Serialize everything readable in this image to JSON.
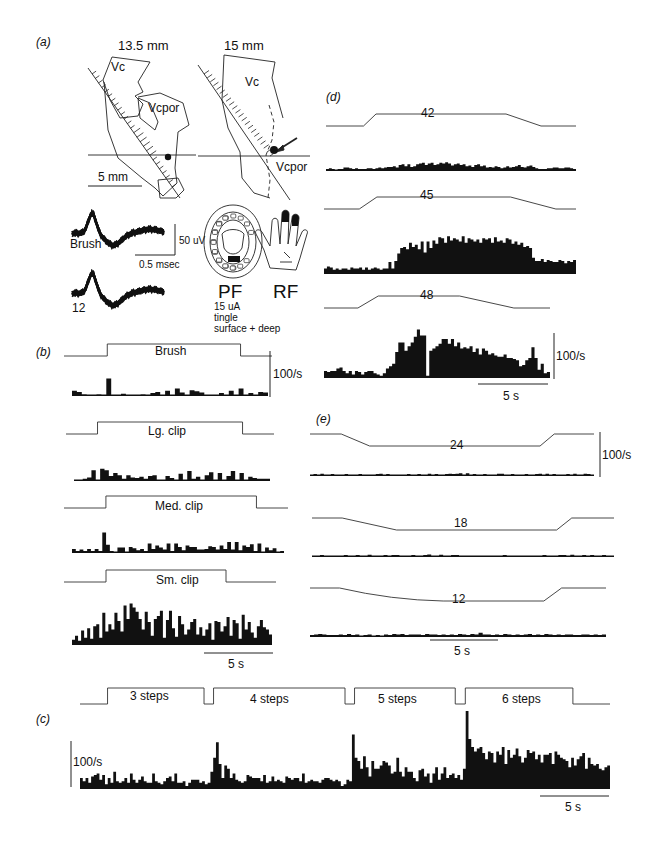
{
  "figure": {
    "panels": {
      "a": {
        "label": "(a)",
        "sections": [
          {
            "title": "13.5 mm",
            "regions": [
              "Vc",
              "Vcpor"
            ],
            "scale_bar": "5 mm"
          },
          {
            "title": "15 mm",
            "regions": [
              "Vc",
              "Vcpor"
            ]
          }
        ],
        "waveforms": [
          {
            "label": "Brush"
          },
          {
            "label": "12"
          }
        ],
        "waveform_scale": {
          "amplitude": "50 uV",
          "time": "0.5 msec"
        },
        "projected_field": {
          "label": "PF",
          "notes": [
            "15 uA",
            "tingle",
            "surface + deep"
          ]
        },
        "receptive_field": {
          "label": "RF"
        }
      },
      "b": {
        "label": "(b)",
        "scale_rate": "100/s",
        "scale_time": "5 s"
      },
      "c": {
        "label": "(c)",
        "scale_rate": "100/s",
        "scale_time": "5 s"
      },
      "d": {
        "label": "(d)",
        "scale_rate": "100/s",
        "scale_time": "5 s"
      },
      "e": {
        "label": "(e)",
        "scale_rate": "100/s",
        "scale_time": "5 s"
      }
    }
  },
  "chart_data": [
    {
      "panel": "b",
      "type": "bar",
      "title": "Brush",
      "ylabel": "100/s",
      "xlabel": "5 s",
      "stimulus": "step",
      "stim_on_frac": [
        0.18,
        0.86
      ],
      "values": [
        18,
        14,
        6,
        4,
        2,
        6,
        2,
        60,
        2,
        2,
        8,
        2,
        4,
        4,
        6,
        4,
        10,
        14,
        2,
        18,
        2,
        26,
        12,
        4,
        20,
        16,
        12,
        4,
        2,
        4,
        10,
        2,
        18,
        2,
        26,
        2,
        10,
        2,
        14,
        12
      ]
    },
    {
      "panel": "b",
      "type": "bar",
      "title": "Lg. clip",
      "ylabel": "100/s",
      "xlabel": "5 s",
      "stimulus": "step",
      "stim_on_frac": [
        0.12,
        0.86
      ],
      "values": [
        4,
        2,
        6,
        10,
        30,
        4,
        34,
        30,
        14,
        22,
        16,
        6,
        16,
        10,
        8,
        12,
        6,
        14,
        16,
        4,
        4,
        14,
        8,
        4,
        20,
        4,
        28,
        6,
        12,
        4,
        16,
        24,
        4,
        22,
        2,
        14,
        28,
        4,
        22,
        2,
        12,
        8,
        6,
        6,
        6
      ]
    },
    {
      "panel": "b",
      "type": "bar",
      "title": "Med. clip",
      "ylabel": "100/s",
      "xlabel": "5 s",
      "stimulus": "step",
      "stim_on_frac": [
        0.16,
        0.87
      ],
      "values": [
        12,
        6,
        10,
        6,
        12,
        6,
        12,
        6,
        60,
        24,
        6,
        4,
        16,
        16,
        4,
        18,
        14,
        8,
        12,
        6,
        28,
        12,
        22,
        16,
        10,
        28,
        6,
        28,
        18,
        8,
        22,
        18,
        18,
        10,
        10,
        12,
        20,
        18,
        10,
        22,
        12,
        32,
        10,
        32,
        8,
        22,
        18,
        26,
        6,
        28,
        4,
        16,
        8,
        14,
        4,
        6
      ]
    },
    {
      "panel": "b",
      "type": "bar",
      "title": "Sm. clip",
      "ylabel": "100/s",
      "xlabel": "5 s",
      "stimulus": "step",
      "stim_on_frac": [
        0.17,
        0.77
      ],
      "values": [
        10,
        18,
        8,
        28,
        14,
        32,
        12,
        36,
        40,
        14,
        62,
        26,
        40,
        30,
        62,
        46,
        26,
        76,
        50,
        80,
        72,
        64,
        50,
        30,
        64,
        44,
        18,
        50,
        56,
        66,
        14,
        48,
        66,
        32,
        16,
        56,
        40,
        20,
        30,
        44,
        50,
        20,
        34,
        18,
        30,
        42,
        10,
        46,
        44,
        26,
        36,
        54,
        18,
        48,
        42,
        12,
        58,
        30,
        44,
        24,
        14,
        36,
        48,
        34,
        30,
        20
      ]
    },
    {
      "panel": "c",
      "type": "bar",
      "ylabel": "100/s",
      "xlabel": "5 s",
      "stimulus": "steps",
      "steps": [
        {
          "label": "3 steps",
          "on": [
            0.052,
            0.234
          ]
        },
        {
          "label": "4 steps",
          "on": [
            0.252,
            0.5
          ]
        },
        {
          "label": "5 steps",
          "on": [
            0.518,
            0.708
          ]
        },
        {
          "label": "6 steps",
          "on": [
            0.727,
            0.93
          ]
        }
      ],
      "values": [
        14,
        10,
        14,
        8,
        16,
        18,
        20,
        12,
        18,
        6,
        14,
        8,
        22,
        10,
        8,
        10,
        14,
        8,
        20,
        12,
        8,
        12,
        16,
        10,
        8,
        8,
        20,
        10,
        8,
        6,
        10,
        14,
        16,
        10,
        20,
        8,
        8,
        10,
        4,
        8,
        12,
        12,
        12,
        8,
        10,
        6,
        8,
        22,
        40,
        60,
        32,
        14,
        30,
        26,
        14,
        20,
        12,
        10,
        8,
        10,
        18,
        16,
        14,
        14,
        14,
        10,
        18,
        8,
        10,
        16,
        10,
        12,
        10,
        8,
        16,
        14,
        12,
        14,
        14,
        10,
        20,
        8,
        10,
        12,
        10,
        10,
        8,
        12,
        14,
        14,
        12,
        10,
        12,
        10,
        4,
        6,
        12,
        10,
        70,
        40,
        36,
        26,
        42,
        28,
        16,
        36,
        26,
        26,
        30,
        36,
        34,
        30,
        20,
        22,
        40,
        22,
        16,
        28,
        22,
        22,
        14,
        10,
        24,
        26,
        16,
        20,
        8,
        20,
        28,
        12,
        20,
        28,
        14,
        18,
        20,
        14,
        18,
        12,
        26,
        100,
        64,
        54,
        48,
        52,
        54,
        46,
        38,
        48,
        46,
        34,
        48,
        44,
        54,
        32,
        50,
        40,
        44,
        52,
        42,
        34,
        40,
        50,
        46,
        48,
        38,
        44,
        34,
        44,
        44,
        46,
        32,
        48,
        44,
        40,
        38,
        36,
        28,
        40,
        30,
        38,
        42,
        46,
        26,
        40,
        32,
        30,
        32,
        26,
        24,
        28,
        30
      ]
    },
    {
      "panel": "d",
      "type": "bar",
      "title": "42",
      "ylabel": "100/s",
      "xlabel": "5 s",
      "stimulus": "ramp",
      "ramp": [
        0.15,
        0.2,
        0.72,
        0.86
      ],
      "values": [
        6,
        8,
        6,
        4,
        6,
        6,
        10,
        10,
        8,
        6,
        8,
        6,
        6,
        6,
        8,
        8,
        6,
        8,
        10,
        8,
        10,
        12,
        12,
        14,
        10,
        18,
        20,
        14,
        20,
        12,
        14,
        20,
        22,
        24,
        18,
        22,
        24,
        18,
        20,
        24,
        22,
        26,
        22,
        16,
        20,
        22,
        18,
        20,
        14,
        16,
        12,
        18,
        20,
        14,
        16,
        10,
        12,
        10,
        14,
        12,
        8,
        10,
        14,
        10,
        12,
        14,
        18,
        12,
        10,
        14,
        16,
        12,
        8,
        6,
        6,
        6,
        8,
        8,
        10,
        10,
        8,
        8,
        10,
        10,
        8,
        6
      ]
    },
    {
      "panel": "d",
      "type": "bar",
      "title": "45",
      "ylabel": "100/s",
      "xlabel": "5 s",
      "stimulus": "ramp",
      "ramp": [
        0.14,
        0.21,
        0.74,
        0.92
      ],
      "values": [
        10,
        14,
        12,
        8,
        10,
        8,
        10,
        10,
        8,
        12,
        10,
        10,
        12,
        8,
        12,
        8,
        10,
        12,
        10,
        8,
        10,
        10,
        22,
        10,
        24,
        38,
        48,
        50,
        46,
        58,
        50,
        54,
        46,
        60,
        40,
        60,
        48,
        62,
        56,
        68,
        66,
        58,
        70,
        62,
        66,
        64,
        60,
        70,
        58,
        66,
        64,
        60,
        64,
        58,
        66,
        64,
        66,
        58,
        68,
        60,
        62,
        58,
        66,
        64,
        56,
        60,
        54,
        58,
        50,
        52,
        48,
        30,
        24,
        24,
        28,
        22,
        26,
        24,
        22,
        22,
        26,
        24,
        20,
        24,
        22,
        26
      ]
    },
    {
      "panel": "d",
      "type": "bar",
      "title": "48",
      "ylabel": "100/s",
      "xlabel": "5 s",
      "stimulus": "ramp",
      "ramp": [
        0.15,
        0.24,
        0.6,
        0.84
      ],
      "values": [
        12,
        10,
        12,
        12,
        16,
        18,
        12,
        8,
        12,
        6,
        12,
        10,
        6,
        10,
        12,
        12,
        8,
        6,
        4,
        8,
        16,
        20,
        24,
        44,
        60,
        60,
        46,
        54,
        60,
        70,
        82,
        72,
        72,
        4,
        46,
        50,
        54,
        58,
        66,
        66,
        58,
        66,
        54,
        60,
        50,
        52,
        50,
        54,
        44,
        50,
        40,
        50,
        46,
        40,
        42,
        38,
        36,
        36,
        40,
        34,
        34,
        32,
        30,
        20,
        22,
        30,
        34,
        52,
        34,
        14,
        24,
        8,
        10
      ]
    },
    {
      "panel": "e",
      "type": "bar",
      "title": "24",
      "ylabel": "100/s",
      "xlabel": "5 s",
      "stimulus": "ramp_down",
      "ramp": [
        0.11,
        0.21,
        0.81,
        0.86
      ],
      "values": [
        8,
        10,
        8,
        12,
        6,
        6,
        10,
        6,
        6,
        6,
        10,
        6,
        6,
        8,
        10,
        6,
        8,
        6,
        6,
        10,
        12,
        6,
        10,
        8,
        6,
        6,
        6,
        8,
        10,
        6,
        6,
        10,
        6,
        8,
        12,
        6,
        10,
        8,
        8,
        10,
        12,
        10,
        12,
        14,
        8,
        14,
        6,
        10,
        6,
        6,
        10,
        6,
        6,
        8,
        12,
        12,
        8,
        6,
        10,
        6,
        6,
        8,
        10,
        6,
        6,
        10,
        12,
        8,
        12,
        6,
        10,
        8,
        6,
        6,
        10,
        8,
        12,
        6,
        6,
        12,
        10,
        4
      ]
    },
    {
      "panel": "e",
      "type": "bar",
      "title": "18",
      "ylabel": "100/s",
      "xlabel": "5 s",
      "stimulus": "ramp_down",
      "ramp": [
        0.1,
        0.28,
        0.81,
        0.86
      ],
      "values": [
        10,
        8,
        12,
        6,
        6,
        10,
        8,
        8,
        12,
        10,
        10,
        12,
        10,
        8,
        14,
        10,
        10,
        8,
        12,
        10,
        12,
        12,
        10,
        8,
        10,
        12,
        10,
        8,
        12,
        16,
        10,
        8,
        14,
        10,
        8,
        12,
        12,
        10,
        8,
        10,
        4,
        8,
        8,
        8,
        10,
        8,
        10,
        10,
        12,
        10,
        8,
        10,
        8,
        10,
        8,
        10,
        8,
        8,
        12,
        10,
        8,
        8,
        12,
        12,
        10,
        14,
        8,
        10,
        12,
        10,
        12,
        10,
        10,
        12,
        8,
        10
      ]
    },
    {
      "panel": "e",
      "type": "bar",
      "title": "12",
      "ylabel": "100/s",
      "xlabel": "5 s",
      "stimulus": "ramp_down_curved",
      "ramp": [
        0.1,
        0.45,
        0.79,
        0.85
      ],
      "values": [
        8,
        10,
        12,
        10,
        8,
        8,
        8,
        10,
        8,
        12,
        8,
        10,
        6,
        8,
        10,
        6,
        8,
        6,
        10,
        8,
        12,
        10,
        12,
        8,
        10,
        10,
        10,
        8,
        12,
        10,
        10,
        8,
        10,
        8,
        10,
        8,
        12,
        10,
        8,
        12,
        10,
        16,
        10,
        10,
        8,
        10,
        8,
        12,
        10,
        8,
        10,
        8,
        10,
        12,
        8,
        10,
        8,
        12,
        10,
        8,
        10,
        8,
        10,
        10,
        8,
        8,
        10,
        10,
        8,
        10,
        8,
        10
      ]
    }
  ]
}
